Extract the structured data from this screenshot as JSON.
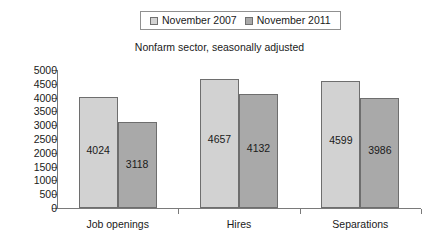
{
  "legend": {
    "entries": [
      {
        "label": "November 2007",
        "color": "#d2d2d2"
      },
      {
        "label": "November 2011",
        "color": "#a9a9a9"
      }
    ]
  },
  "subtitle": "Nonfarm sector, seasonally adjusted",
  "chart_data": {
    "type": "bar",
    "title": "",
    "subtitle": "Nonfarm sector, seasonally adjusted",
    "xlabel": "",
    "ylabel": "",
    "ylim": [
      0,
      5000
    ],
    "yticks": [
      0,
      500,
      1000,
      1500,
      2000,
      2500,
      3000,
      3500,
      4000,
      4500,
      5000
    ],
    "ytick_labels": [
      "0",
      "500",
      "1000",
      "1500",
      "2000",
      "2500",
      "3000",
      "3500",
      "4000",
      "4500",
      "5000"
    ],
    "grid": false,
    "legend_position": "top-center",
    "categories": [
      "Job openings",
      "Hires",
      "Separations"
    ],
    "series": [
      {
        "name": "November 2007",
        "color": "#d2d2d2",
        "values": [
          4024,
          4657,
          4599
        ],
        "labels": [
          "4024",
          "4657",
          "4599"
        ]
      },
      {
        "name": "November 2011",
        "color": "#a9a9a9",
        "values": [
          3118,
          4132,
          3986
        ],
        "labels": [
          "3118",
          "4132",
          "3986"
        ]
      }
    ]
  }
}
